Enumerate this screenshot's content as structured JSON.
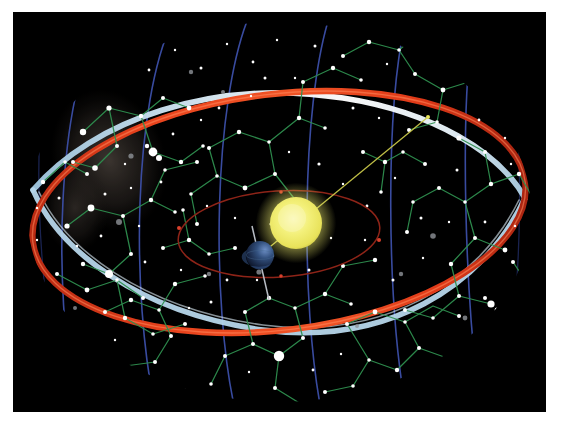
{
  "figure": {
    "frame": {
      "border_color": "#ffffff",
      "plate_color": "#000000",
      "plate_x": 13,
      "plate_y": 12,
      "plate_w": 533,
      "plate_h": 400
    }
  },
  "colors": {
    "background": "#000000",
    "border": "#ffffff",
    "ecliptic_band": "#e03a18",
    "ecliptic_band_highlight": "#ff7a4a",
    "celestial_equator_band": "#b9d8ea",
    "celestial_equator_highlight": "#ffffff",
    "meridian_line": "#3a4fa8",
    "meridian_line_dim": "#26307a",
    "constellation_line": "#2f8f4f",
    "star": "#ffffff",
    "star_dim": "#9aa0a6",
    "sun": "#f2f06a",
    "sun_core": "#f7f4a8",
    "sun_glow": "#d9d24a",
    "earth": "#253a63",
    "earth_lit": "#4a6ea8",
    "earth_axis": "#b7bcc4",
    "earth_orbit": "#8b2020",
    "orbit_node": "#d83a2a",
    "sight_line": "#c9c84a",
    "milky_way": "#3a3430"
  },
  "chart_data": {
    "type": "diagram",
    "center": {
      "cx": 266,
      "cy": 200
    },
    "ecliptic": {
      "label": "ecliptic",
      "rx": 248,
      "ry": 118,
      "rotation_deg": -7,
      "band_width": 7,
      "color": "#e03a18"
    },
    "celestial_equator": {
      "label": "celestial equator",
      "rx": 250,
      "ry": 112,
      "rotation_deg": 16,
      "band_width": 6,
      "color": "#b9d8ea"
    },
    "sphere_outline": {
      "rx": 252,
      "ry": 190
    },
    "meridians": [
      {
        "id": "m1",
        "x_offset": -170,
        "tilt": -14
      },
      {
        "id": "m2",
        "x_offset": -96,
        "tilt": -11
      },
      {
        "id": "m3",
        "x_offset": -20,
        "tilt": -7
      },
      {
        "id": "m4",
        "x_offset": 60,
        "tilt": -3
      },
      {
        "id": "m5",
        "x_offset": 140,
        "tilt": 2
      },
      {
        "id": "m6",
        "x_offset": 210,
        "tilt": 6
      }
    ],
    "sun": {
      "cx": 283,
      "cy": 211,
      "r": 26,
      "label": "Sun"
    },
    "earth": {
      "cx": 247,
      "cy": 243,
      "r": 14,
      "label": "Earth",
      "axis_tilt_deg": 23.5
    },
    "earth_orbit": {
      "cx": 266,
      "cy": 222,
      "rx": 101,
      "ry": 43,
      "rotation_deg": -4,
      "node_count": 4
    },
    "sight_line": {
      "x1": 247,
      "y1": 243,
      "x2": 415,
      "y2": 105,
      "label": "line of sight to zodiac"
    },
    "star_count": 300,
    "constellation_line_count": 120
  },
  "accessibility": {
    "alt": "Illustration of the celestial sphere: a black field of white stars joined by green constellation lines, crossed by a red ecliptic band and a pale blue celestial equator band, with blue meridian arcs; at the centre the yellow Sun and the small blue Earth on its dark red orbit, a yellow sight line running from Earth past the Sun to the zodiac."
  }
}
